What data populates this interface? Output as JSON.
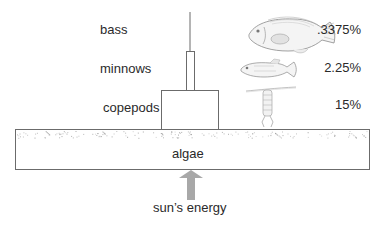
{
  "levels": [
    {
      "name": "bass",
      "percent": ".3375%",
      "icon": "bass-fish-icon"
    },
    {
      "name": "minnows",
      "percent": "2.25%",
      "icon": "minnow-fish-icon"
    },
    {
      "name": "copepods",
      "percent": "15%",
      "icon": "copepod-icon"
    }
  ],
  "base": {
    "name": "algae"
  },
  "energy_source": {
    "label": "sun’s energy",
    "icon": "arrow-up-icon"
  },
  "colors": {
    "line": "#6b6b6b",
    "arrow": "#a8a8a8",
    "text": "#2a2a2a",
    "speckle": "#9a9a9a"
  }
}
